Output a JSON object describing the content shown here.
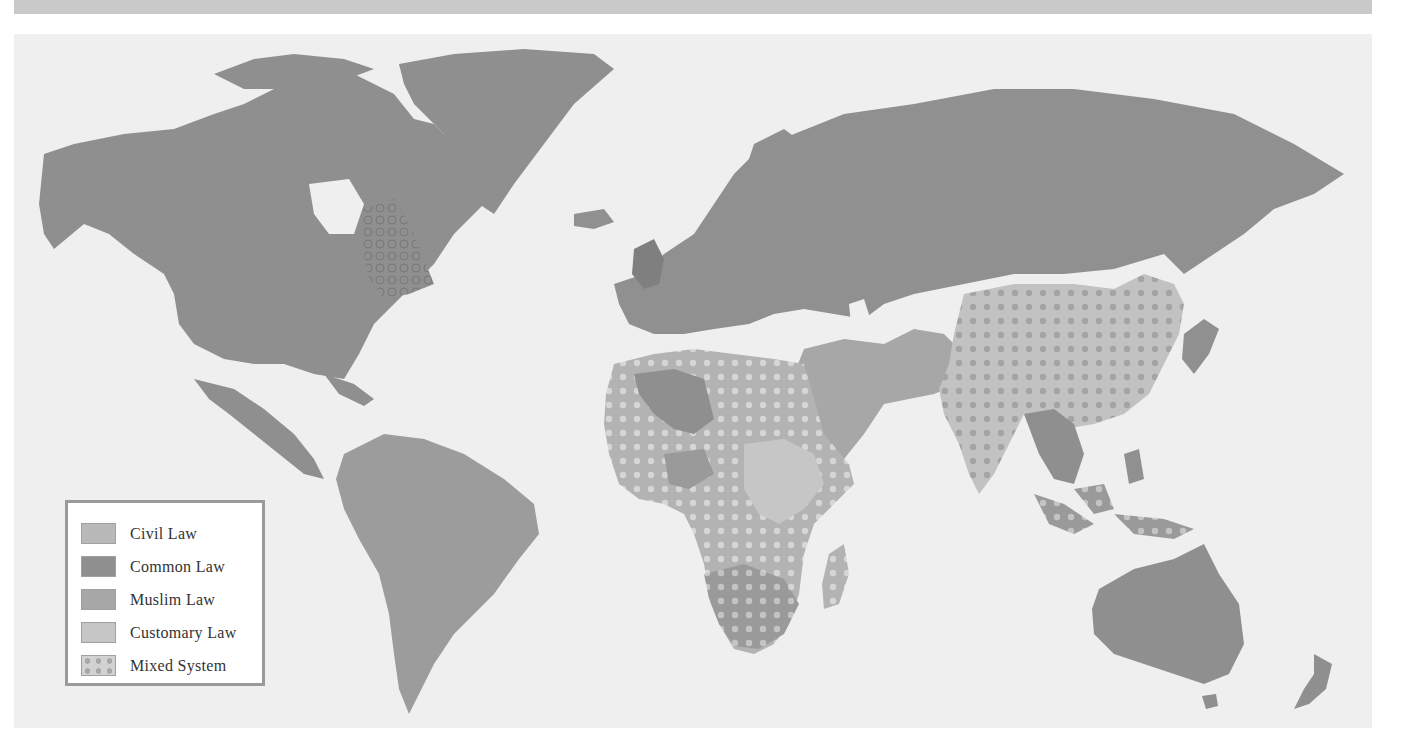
{
  "figure": {
    "type": "world map"
  },
  "colors": {
    "top_band": "#c9c9c9",
    "ocean": "#efefef",
    "civil_law": "#b9b9b9",
    "common_law": "#8f8f8f",
    "muslim_law": "#a7a7a7",
    "customary_law": "#c6c6c6",
    "mixed_system_base": "#bdbdbd",
    "mixed_system_dot": "#d8d8d8",
    "legend_border": "#9a9a9a"
  },
  "legend": {
    "items": [
      {
        "label": "Civil Law",
        "key": "civil_law"
      },
      {
        "label": "Common Law",
        "key": "common_law"
      },
      {
        "label": "Muslim Law",
        "key": "muslim_law"
      },
      {
        "label": "Customary Law",
        "key": "customary_law"
      },
      {
        "label": "Mixed System",
        "key": "mixed_system"
      }
    ]
  },
  "regions": [
    {
      "name": "North America (USA, Canada)",
      "system": "common_law"
    },
    {
      "name": "Quebec",
      "system": "mixed_system"
    },
    {
      "name": "Latin America",
      "system": "civil_law"
    },
    {
      "name": "Greenland",
      "system": "civil_law"
    },
    {
      "name": "Europe",
      "system": "civil_law"
    },
    {
      "name": "United Kingdom / Ireland",
      "system": "common_law"
    },
    {
      "name": "Russia & Central Asia",
      "system": "civil_law"
    },
    {
      "name": "Middle East / Arabian Peninsula",
      "system": "muslim_law"
    },
    {
      "name": "Iran / Afghanistan / Pakistan",
      "system": "muslim_law"
    },
    {
      "name": "North & West Africa",
      "system": "mixed_system"
    },
    {
      "name": "Central & East Africa",
      "system": "customary_law"
    },
    {
      "name": "Southern Africa",
      "system": "mixed_system"
    },
    {
      "name": "Madagascar",
      "system": "mixed_system"
    },
    {
      "name": "India",
      "system": "mixed_system"
    },
    {
      "name": "China",
      "system": "mixed_system"
    },
    {
      "name": "Mongolia",
      "system": "mixed_system"
    },
    {
      "name": "Southeast Asia",
      "system": "civil_law"
    },
    {
      "name": "Indonesia / Malaysia",
      "system": "mixed_system"
    },
    {
      "name": "Japan / Korea",
      "system": "civil_law"
    },
    {
      "name": "Australia",
      "system": "common_law"
    },
    {
      "name": "New Zealand",
      "system": "common_law"
    }
  ]
}
